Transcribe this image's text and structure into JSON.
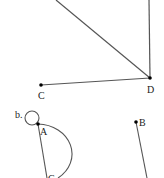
{
  "diagram": {
    "part_a": {
      "points": [
        {
          "name": "C",
          "label": "C"
        },
        {
          "name": "D",
          "label": "D"
        }
      ]
    },
    "part_b": {
      "marker": "b.",
      "points": [
        {
          "name": "A",
          "label": "A"
        },
        {
          "name": "B",
          "label": "B"
        },
        {
          "name": "C",
          "label": "C"
        }
      ]
    },
    "colors": {
      "line": "#555555",
      "point": "#000000"
    }
  }
}
